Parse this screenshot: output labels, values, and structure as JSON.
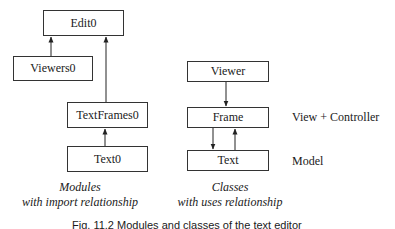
{
  "modules": {
    "edit": "Edit0",
    "viewers": "Viewers0",
    "textframes": "TextFrames0",
    "text": "Text0",
    "caption_line1": "Modules",
    "caption_line2": "with import relationship"
  },
  "classes": {
    "viewer": "Viewer",
    "frame": "Frame",
    "text": "Text",
    "caption_line1": "Classes",
    "caption_line2": "with uses relationship"
  },
  "layers": {
    "view_controller": "View + Controller",
    "model": "Model"
  },
  "figure_caption": "Fig. 11.2 Modules and classes of the text editor",
  "edges": [
    {
      "from": "Viewers0",
      "to": "Edit0",
      "type": "import"
    },
    {
      "from": "TextFrames0",
      "to": "Edit0",
      "type": "import"
    },
    {
      "from": "Text0",
      "to": "TextFrames0",
      "type": "import"
    },
    {
      "from": "Viewer",
      "to": "Frame",
      "type": "uses"
    },
    {
      "from": "Frame",
      "to": "Text",
      "type": "uses"
    },
    {
      "from": "Text",
      "to": "Frame",
      "type": "uses"
    }
  ]
}
